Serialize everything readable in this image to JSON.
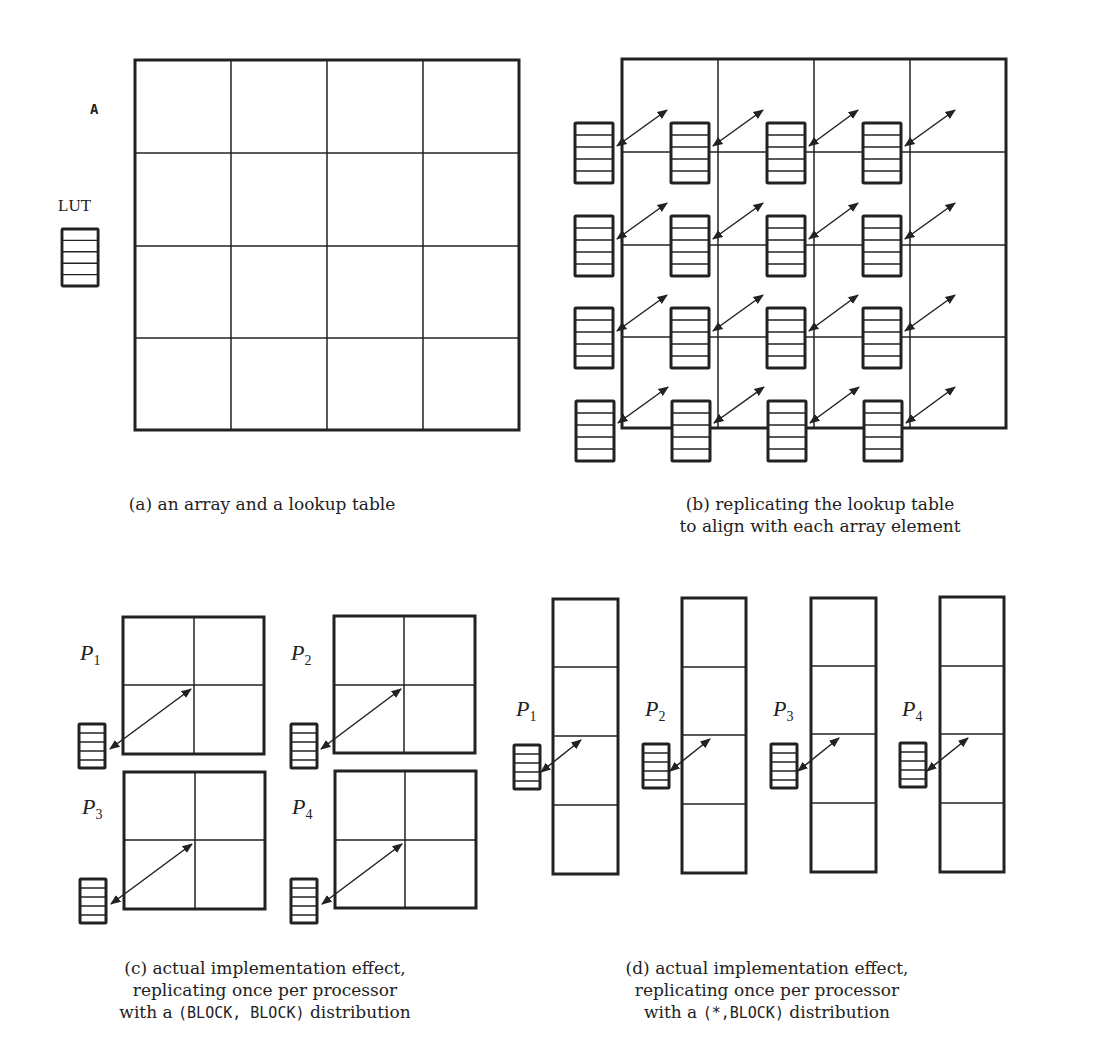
{
  "panels": {
    "a": {
      "array_label": "A",
      "lut_label": "LUT",
      "caption": "(a) an array and a lookup table",
      "grid": {
        "rows": 4,
        "cols": 4
      }
    },
    "b": {
      "caption_line1": "(b) replicating the lookup table",
      "caption_line2": "to align with each array element",
      "grid": {
        "rows": 4,
        "cols": 4
      },
      "replicated_luts": 16
    },
    "c": {
      "processors": [
        {
          "name": "P",
          "sub": "1"
        },
        {
          "name": "P",
          "sub": "2"
        },
        {
          "name": "P",
          "sub": "3"
        },
        {
          "name": "P",
          "sub": "4"
        }
      ],
      "caption_line1": "(c) actual implementation effect,",
      "caption_line2": "replicating once per processor",
      "caption_line3_pre": "with a ",
      "caption_line3_code": "(BLOCK, BLOCK)",
      "caption_line3_post": " distribution",
      "block_grid": {
        "rows": 2,
        "cols": 2
      }
    },
    "d": {
      "processors": [
        {
          "name": "P",
          "sub": "1"
        },
        {
          "name": "P",
          "sub": "2"
        },
        {
          "name": "P",
          "sub": "3"
        },
        {
          "name": "P",
          "sub": "4"
        }
      ],
      "caption_line1": "(d) actual implementation effect,",
      "caption_line2": "replicating once per processor",
      "caption_line3_pre": "with a ",
      "caption_line3_code": "(*,BLOCK)",
      "caption_line3_post": " distribution",
      "column_grid": {
        "rows": 4,
        "cols": 1
      }
    }
  },
  "colors": {
    "stroke": "#222222",
    "background": "#ffffff"
  }
}
